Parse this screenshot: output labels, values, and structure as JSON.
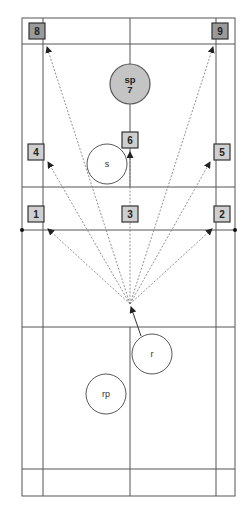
{
  "diagram": {
    "type": "badminton-court-shot-zones",
    "court": {
      "outer_lines": {
        "left": 22,
        "right": 235,
        "top": 18,
        "bottom": 496
      },
      "singles_lines": {
        "left": 43,
        "right": 216
      },
      "center_x": 130,
      "back_service_line_top": 44,
      "front_service_line_top": 187,
      "net_y": 230,
      "front_service_line_bottom": 327,
      "back_service_line_bottom": 469
    },
    "zones": [
      {
        "id": "zone-1",
        "label": "1",
        "x": 36,
        "y": 214,
        "style": "light"
      },
      {
        "id": "zone-2",
        "label": "2",
        "x": 222,
        "y": 214,
        "style": "light"
      },
      {
        "id": "zone-3",
        "label": "3",
        "x": 130,
        "y": 214,
        "style": "light"
      },
      {
        "id": "zone-4",
        "label": "4",
        "x": 36,
        "y": 152,
        "style": "light"
      },
      {
        "id": "zone-5",
        "label": "5",
        "x": 222,
        "y": 152,
        "style": "light"
      },
      {
        "id": "zone-6",
        "label": "6",
        "x": 130,
        "y": 140,
        "style": "light"
      },
      {
        "id": "zone-8",
        "label": "8",
        "x": 37,
        "y": 31,
        "style": "dark"
      },
      {
        "id": "zone-9",
        "label": "9",
        "x": 220,
        "y": 31,
        "style": "dark"
      }
    ],
    "players": [
      {
        "id": "player-sp",
        "label_top": "sp",
        "label_bottom": "7",
        "cx": 130,
        "cy": 84,
        "r": 20,
        "style": "shaded"
      },
      {
        "id": "player-s",
        "label": "s",
        "cx": 107,
        "cy": 164,
        "r": 20,
        "style": "plain"
      },
      {
        "id": "player-r",
        "label": "r",
        "cx": 152,
        "cy": 354,
        "r": 20,
        "style": "plain"
      },
      {
        "id": "player-rp",
        "label": "rp",
        "cx": 106,
        "cy": 394,
        "r": 20,
        "style": "plain"
      }
    ],
    "shot_origin": {
      "x": 130,
      "y": 304
    },
    "trajectories": [
      {
        "to": "zone-1",
        "x": 48,
        "y": 229
      },
      {
        "to": "zone-2",
        "x": 212,
        "y": 229
      },
      {
        "to": "zone-4",
        "x": 48,
        "y": 162
      },
      {
        "to": "zone-5",
        "x": 210,
        "y": 162
      },
      {
        "to": "zone-6",
        "x": 130,
        "y": 152
      },
      {
        "to": "zone-8",
        "x": 47,
        "y": 47
      },
      {
        "to": "zone-9",
        "x": 213,
        "y": 47
      }
    ],
    "movement_arrow": {
      "from_x": 141,
      "from_y": 336,
      "to_x": 131,
      "to_y": 307
    }
  }
}
